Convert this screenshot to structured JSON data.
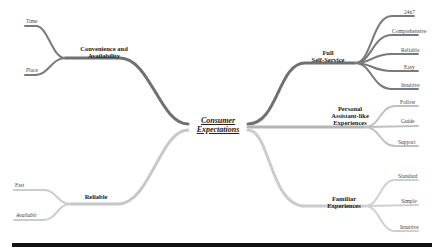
{
  "title": "Consumer Expectations",
  "colors": {
    "dark_branch": "#6e6e6e",
    "light_branch": "#c8c8c8",
    "medium_branch": "#9a9a9a",
    "rule": "#111111"
  },
  "center": {
    "line1": "Consumer",
    "line2": "Expectations"
  },
  "branches": {
    "convenience": {
      "line1": "Convenience and",
      "line2": "Availability",
      "leaves": [
        "Time",
        "Place"
      ]
    },
    "self_service": {
      "line1": "Full",
      "line2": "Self-Service",
      "leaves": [
        "24x7",
        "Comprehensive",
        "Reliable",
        "Easy",
        "Intuitive"
      ]
    },
    "assistant": {
      "line1": "Personal",
      "line2": "Assistant-like",
      "line3": "Experiences",
      "leaves": [
        "Follow",
        "Guide",
        "Support"
      ]
    },
    "reliable": {
      "line1": "Reliable",
      "leaves": [
        "Fast",
        "Available"
      ]
    },
    "familiar": {
      "line1": "Familiar",
      "line2": "Experiences",
      "leaves": [
        "Standard",
        "Simple",
        "Intuitive"
      ]
    }
  }
}
